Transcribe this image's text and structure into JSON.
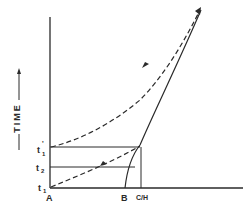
{
  "diagram": {
    "y_axis_label": "TIME",
    "x_labels": {
      "origin": "A",
      "b": "B",
      "c_over_h": "C/H"
    },
    "y_labels": {
      "t1": "t",
      "t1_sub": "1",
      "t2": "t",
      "t2_sub": "2",
      "t1_prime": "t",
      "t1_prime_sub": "1",
      "t1_prime_mark": "'"
    },
    "curves": [
      {
        "name": "solid-boundary-curve",
        "style": "solid",
        "from": "B",
        "to": "upper-right",
        "arrow": false
      },
      {
        "name": "lower-dashed-characteristic",
        "style": "dashed",
        "from": "t1 at A",
        "to": "intersection at t1'",
        "arrow": true
      },
      {
        "name": "upper-dashed-characteristic",
        "style": "dashed",
        "from": "t1' on time axis",
        "to": "upper-right",
        "arrow": true
      }
    ],
    "colors": {
      "ink": "#2a2a2a",
      "background": "#ffffff"
    }
  }
}
